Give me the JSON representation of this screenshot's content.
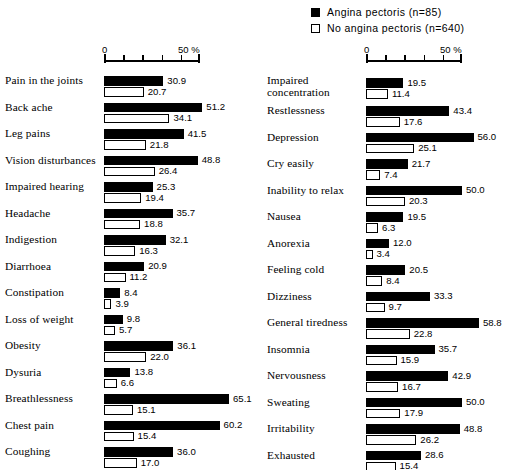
{
  "legend": {
    "entries": [
      {
        "label": "Angina pectoris (n=85)",
        "swatch": "filled-square-icon",
        "color": "#000000"
      },
      {
        "label": "No angina pectoris (n=640)",
        "swatch": "hollow-square-icon",
        "color": "#ffffff"
      }
    ]
  },
  "axis": {
    "zero_label": "0",
    "max_label": "50 %",
    "min": 0,
    "max": 50,
    "tick_step": 10
  },
  "chart_data": {
    "type": "bar",
    "orientation": "horizontal",
    "title": "",
    "subtitle": "",
    "xlabel": "50 %",
    "ylabel": "",
    "xlim": [
      0,
      50
    ],
    "tick_step": 10,
    "grid": false,
    "legend_position": "top-right",
    "series": [
      {
        "name": "Angina pectoris (n=85)",
        "color": "#000000"
      },
      {
        "name": "No angina pectoris (n=640)",
        "color": "#ffffff"
      }
    ],
    "panels": [
      {
        "id": "left-panel",
        "categories": [
          "Pain in the joints",
          "Back ache",
          "Leg pains",
          "Vision disturbances",
          "Impaired hearing",
          "Headache",
          "Indigestion",
          "Diarrhoea",
          "Constipation",
          "Loss of weight",
          "Obesity",
          "Dysuria",
          "Breathlessness",
          "Chest pain",
          "Coughing"
        ],
        "angina": [
          30.9,
          51.2,
          41.5,
          48.8,
          25.3,
          35.7,
          32.1,
          20.9,
          8.4,
          9.8,
          36.1,
          13.8,
          65.1,
          60.2,
          36.0
        ],
        "no_angina": [
          20.7,
          34.1,
          21.8,
          26.4,
          19.4,
          18.8,
          16.3,
          11.2,
          3.9,
          5.7,
          22.0,
          6.6,
          15.1,
          15.4,
          17.0
        ]
      },
      {
        "id": "right-panel",
        "categories": [
          "Impaired concentration",
          "Restlessness",
          "Depression",
          "Cry easily",
          "Inability to relax",
          "Nausea",
          "Anorexia",
          "Feeling cold",
          "Dizziness",
          "General tiredness",
          "Insomnia",
          "Nervousness",
          "Sweating",
          "Irritability",
          "Exhausted"
        ],
        "angina": [
          19.5,
          43.4,
          56.0,
          21.7,
          50.0,
          19.5,
          12.0,
          20.5,
          33.3,
          58.8,
          35.7,
          42.9,
          50.0,
          48.8,
          28.6
        ],
        "no_angina": [
          11.4,
          17.6,
          25.1,
          7.4,
          20.3,
          6.3,
          3.4,
          8.4,
          9.7,
          22.8,
          15.9,
          16.7,
          17.9,
          26.2,
          15.4
        ]
      }
    ]
  }
}
